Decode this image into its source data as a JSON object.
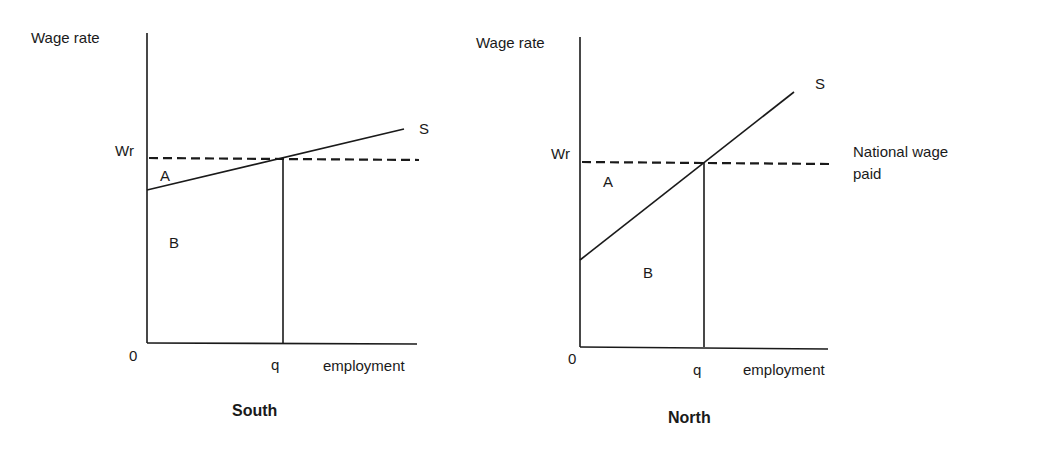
{
  "panels": [
    {
      "title": "South",
      "y_axis_label": "Wage rate",
      "x_axis_label": "employment",
      "origin_label": "0",
      "wage_label": "Wr",
      "quantity_label": "q",
      "supply_label": "S",
      "area_a_label": "A",
      "area_b_label": "B"
    },
    {
      "title": "North",
      "y_axis_label": "Wage rate",
      "x_axis_label": "employment",
      "origin_label": "0",
      "wage_label": "Wr",
      "quantity_label": "q",
      "supply_label": "S",
      "area_a_label": "A",
      "area_b_label": "B",
      "wage_line_label_1": "National wage",
      "wage_line_label_2": "paid"
    }
  ],
  "colors": {
    "line": "#1a1a1a",
    "background": "#ffffff"
  }
}
